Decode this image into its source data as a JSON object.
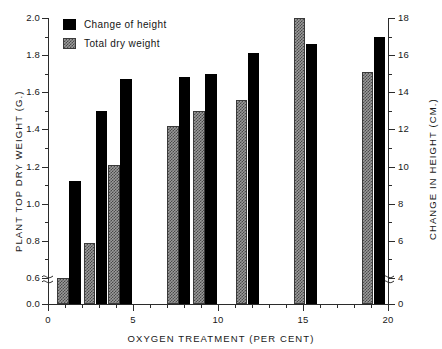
{
  "chart_data": {
    "type": "bar",
    "title": "",
    "xlabel": "OXYGEN TREATMENT (PER CENT)",
    "ylabel": "PLANT TOP DRY WEIGHT (G.)",
    "y2label": "CHANGE IN HEIGHT (CM.)",
    "grid": false,
    "legend_position": "top-left",
    "axis_break": true,
    "axis_break_note": "both y axes broken between 0 and first labeled tick",
    "xlim": [
      0,
      20
    ],
    "ylim": [
      0.0,
      2.0
    ],
    "y2lim": [
      0,
      18
    ],
    "xticks": [
      0,
      5,
      10,
      15,
      20
    ],
    "xtick_labels": [
      "0",
      "5",
      "10",
      "15",
      "20"
    ],
    "x_minor_tick_interval": 1,
    "yticks": [
      0.0,
      0.6,
      0.8,
      1.0,
      1.2,
      1.4,
      1.6,
      1.8,
      2.0
    ],
    "ytick_labels": [
      "0.0",
      "0.6",
      "0.8",
      "1.0",
      "1.2",
      "1.4",
      "1.6",
      "1.8",
      "2.0"
    ],
    "y2ticks": [
      0,
      4,
      6,
      8,
      10,
      12,
      14,
      16,
      18
    ],
    "y2tick_labels": [
      "0",
      "4",
      "6",
      "8",
      "10",
      "12",
      "14",
      "16",
      "18"
    ],
    "categories": [
      "1",
      "2",
      "4",
      "7",
      "9",
      "11",
      "15",
      "19"
    ],
    "series": [
      {
        "name": "Total dry weight",
        "axis": "left",
        "units": "G.",
        "fill": "checker-gray",
        "color": "#9a9a9a",
        "values": [
          0.6,
          0.79,
          1.21,
          1.42,
          1.5,
          1.56,
          2.0,
          1.71
        ]
      },
      {
        "name": "Change of height",
        "axis": "right",
        "units": "CM.",
        "fill": "solid-black",
        "color": "#000000",
        "values": [
          9.2,
          13.0,
          14.7,
          14.8,
          15.0,
          16.1,
          16.6,
          17.0
        ]
      }
    ],
    "bar_layout": {
      "gray_x_positions": [
        0.55,
        2.1,
        3.55,
        7.0,
        8.55,
        11.05,
        14.45,
        18.45
      ],
      "black_x_positions": [
        1.25,
        2.8,
        4.25,
        7.7,
        9.25,
        11.75,
        15.15,
        19.15
      ],
      "bar_width_x_units": 0.68
    }
  },
  "legend": {
    "items": [
      {
        "label": "Change of height",
        "style": "black"
      },
      {
        "label": "Total dry weight",
        "style": "gray"
      }
    ]
  }
}
